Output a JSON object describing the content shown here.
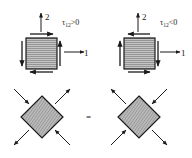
{
  "diagram": {
    "panels": [
      {
        "id": "positive-shear",
        "axis1_label": "1",
        "axis2_label": "2",
        "condition_label": "τ",
        "condition_sub": "12",
        "condition_rel": ">0"
      },
      {
        "id": "negative-shear",
        "axis1_label": "1",
        "axis2_label": "2",
        "condition_label": "τ",
        "condition_sub": "12",
        "condition_rel": "<0"
      }
    ],
    "equals_sign": "="
  },
  "colors": {
    "ink": "#1a1a1a",
    "fill": "#b5b5b5",
    "hatch": "#8c8c8c"
  }
}
